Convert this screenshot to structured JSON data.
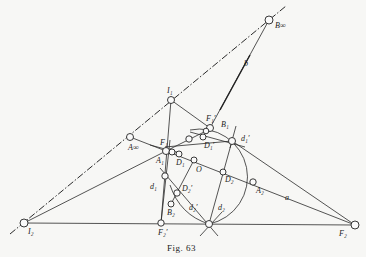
{
  "figure": {
    "caption": "Fig. 63",
    "points": {
      "B_inf": {
        "label": "B∞",
        "x": 269,
        "y": 20
      },
      "I1": {
        "label": "I₁",
        "x": 171,
        "y": 100
      },
      "F1p": {
        "label": "F₁′",
        "x": 210,
        "y": 128
      },
      "B1": {
        "label": "B₁",
        "x": 210,
        "y": 128
      },
      "A_inf": {
        "label": "A∞",
        "x": 130,
        "y": 137
      },
      "F1": {
        "label": "F₁",
        "x": 166,
        "y": 151
      },
      "A1": {
        "label": "A₁",
        "x": 166,
        "y": 151
      },
      "d1p": {
        "label": "d₁′",
        "x": 232,
        "y": 141
      },
      "D1p": {
        "label": "D₁′",
        "x": 203,
        "y": 137
      },
      "D1": {
        "label": "D₁",
        "x": 179,
        "y": 154
      },
      "O": {
        "label": "O",
        "x": 194,
        "y": 160
      },
      "D2": {
        "label": "D₂",
        "x": 223,
        "y": 172
      },
      "A2": {
        "label": "A₂",
        "x": 253,
        "y": 182
      },
      "d1": {
        "label": "d₁",
        "x": 165,
        "y": 176
      },
      "D2p": {
        "label": "D₂′",
        "x": 177,
        "y": 193
      },
      "B2": {
        "label": "B₂",
        "x": 171,
        "y": 204
      },
      "F2p": {
        "label": "F₂′",
        "x": 161,
        "y": 223
      },
      "d2": {
        "label": "d₂",
        "x": 209,
        "y": 224
      },
      "I2": {
        "label": "I₂",
        "x": 24,
        "y": 223
      },
      "F2": {
        "label": "F₂",
        "x": 355,
        "y": 225
      }
    },
    "line_labels": {
      "a": "a",
      "b": "b",
      "d2p": "d₂′"
    }
  }
}
